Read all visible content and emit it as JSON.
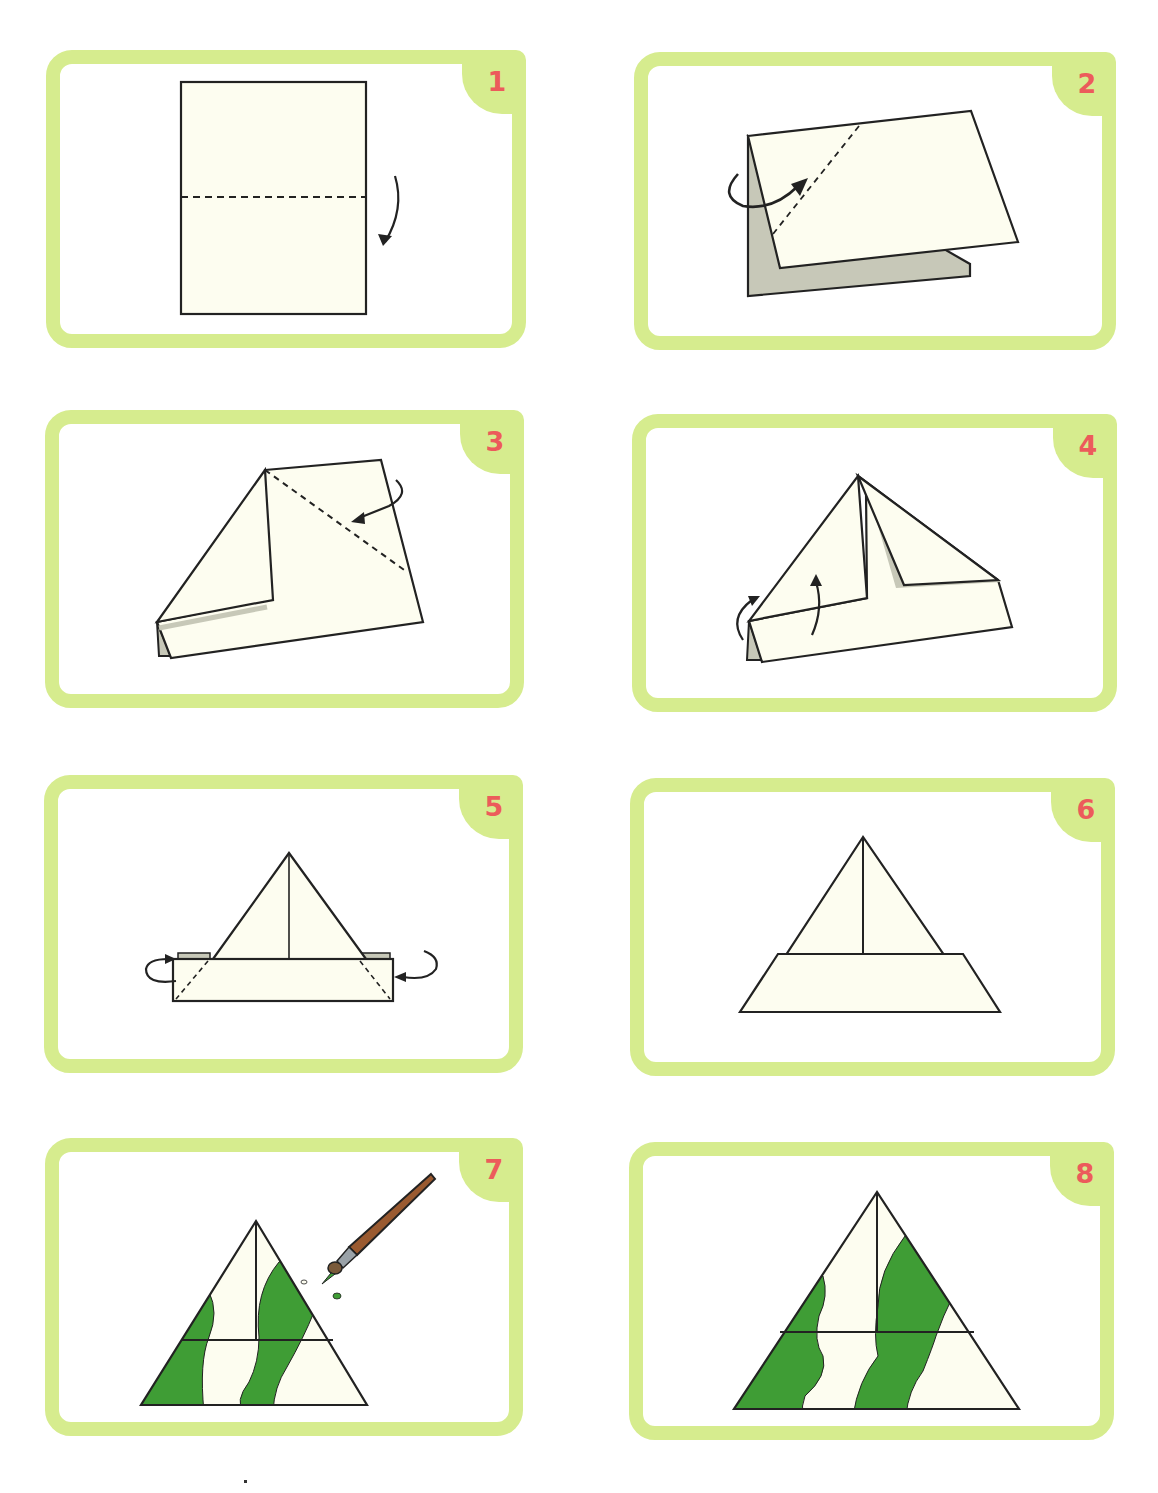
{
  "document": {
    "subject": "Paper hat folding instructions",
    "colors": {
      "frame": "#d6ec8e",
      "step_number": "#ec5b5b",
      "paper": "#fdfdf0",
      "paper_back": "#c7c8b8",
      "paint_green": "#3f9d35",
      "brush_handle": "#9a5a30"
    }
  },
  "steps": [
    {
      "number": "1",
      "description": "Fold the sheet in half along the dashed line"
    },
    {
      "number": "2",
      "description": "Fold the top-left corner down to the center line"
    },
    {
      "number": "3",
      "description": "Fold the top-right corner down to the center line"
    },
    {
      "number": "4",
      "description": "Fold the bottom flaps upward"
    },
    {
      "number": "5",
      "description": "Fold the corners of the brim behind"
    },
    {
      "number": "6",
      "description": "Finished hat"
    },
    {
      "number": "7",
      "description": "Paint stripes on the hat"
    },
    {
      "number": "8",
      "description": "Decorated hat"
    }
  ]
}
